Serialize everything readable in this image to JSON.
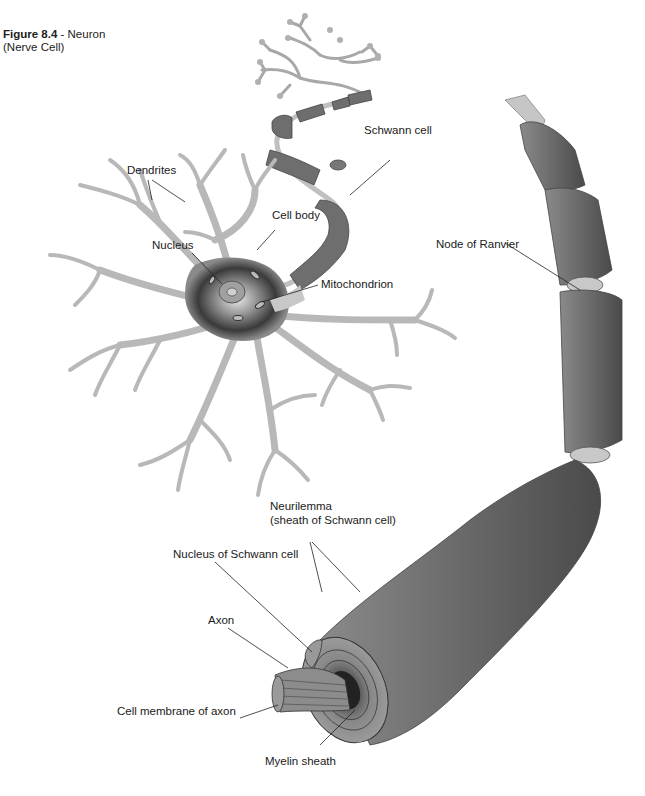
{
  "figure": {
    "number": "Figure 8.4",
    "separator": " - ",
    "title": "Neuron (Nerve Cell)"
  },
  "labels": {
    "dendrites": "Dendrites",
    "schwann_cell": "Schwann cell",
    "cell_body": "Cell body",
    "nucleus": "Nucleus",
    "mitochondrion": "Mitochondrion",
    "node_of_ranvier": "Node of Ranvier",
    "neurilemma_line1": "Neurilemma",
    "neurilemma_line2": "(sheath of Schwann cell)",
    "nucleus_of_schwann_cell": "Nucleus of Schwann cell",
    "axon": "Axon",
    "cell_membrane_of_axon": "Cell membrane of axon",
    "myelin_sheath": "Myelin sheath"
  },
  "colors": {
    "dendrite_fill": "#b8b8b8",
    "sheath_fill": "#6e6e6e",
    "cell_body_dark": "#3a3a3a",
    "node_fill": "#c8c8c8"
  }
}
